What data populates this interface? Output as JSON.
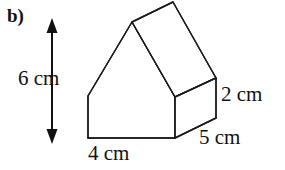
{
  "part_label": "b)",
  "figure": {
    "name": "house-shaped-prism",
    "stroke_color": "#1a1a1a",
    "fill_color": "#ffffff",
    "stroke_width": 1.4,
    "front_face": [
      [
        88,
        96
      ],
      [
        132,
        22
      ],
      [
        175,
        97
      ],
      [
        175,
        138
      ],
      [
        88,
        138
      ]
    ],
    "depth_vector": [
      41,
      -20
    ],
    "back_visible": [
      [
        132,
        22
      ],
      [
        173,
        2
      ],
      [
        216,
        78
      ],
      [
        216,
        118
      ],
      [
        175,
        138
      ]
    ],
    "edges": [
      {
        "name": "front-left-wall",
        "from": [
          88,
          96
        ],
        "to": [
          88,
          138
        ]
      },
      {
        "name": "front-bottom",
        "from": [
          88,
          138
        ],
        "to": [
          175,
          138
        ]
      },
      {
        "name": "front-right-wall",
        "from": [
          175,
          138
        ],
        "to": [
          175,
          97
        ]
      },
      {
        "name": "front-roof-left",
        "from": [
          88,
          96
        ],
        "to": [
          132,
          22
        ]
      },
      {
        "name": "front-roof-right",
        "from": [
          132,
          22
        ],
        "to": [
          175,
          97
        ]
      },
      {
        "name": "ridge",
        "from": [
          132,
          22
        ],
        "to": [
          173,
          2
        ]
      },
      {
        "name": "back-roof-right",
        "from": [
          173,
          2
        ],
        "to": [
          216,
          78
        ]
      },
      {
        "name": "right-eave",
        "from": [
          175,
          97
        ],
        "to": [
          216,
          78
        ]
      },
      {
        "name": "back-right-wall",
        "from": [
          216,
          78
        ],
        "to": [
          216,
          118
        ]
      },
      {
        "name": "bottom-right-depth",
        "from": [
          175,
          138
        ],
        "to": [
          216,
          118
        ]
      }
    ]
  },
  "dimensions": {
    "height": "6 cm",
    "width": "4 cm",
    "depth": "5 cm",
    "side_height": "2 cm"
  },
  "arrow": {
    "name": "height-dimension-arrow",
    "x": 52,
    "y_top": 21,
    "y_bottom": 141,
    "color": "#111111"
  }
}
